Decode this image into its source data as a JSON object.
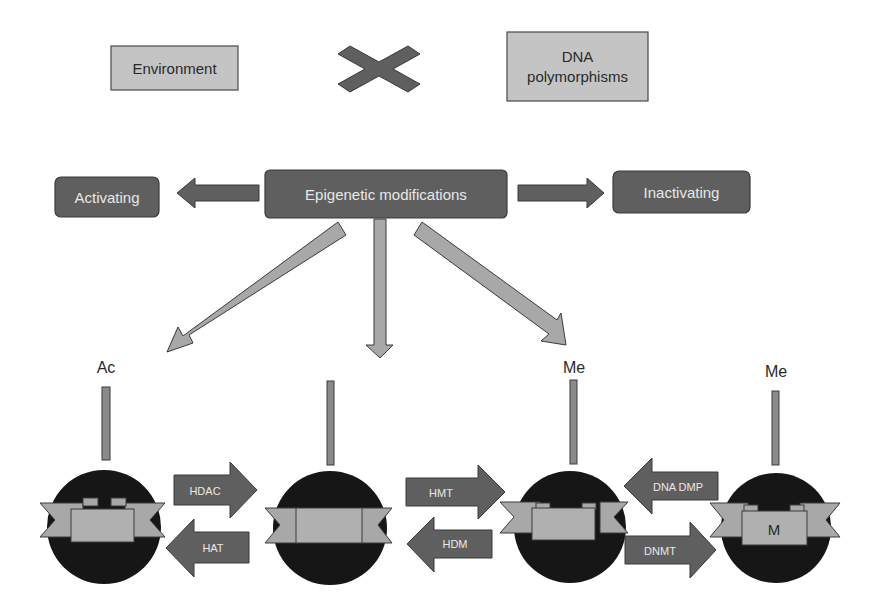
{
  "top_row": {
    "environment_label": "Environment",
    "dna_label_line1": "DNA",
    "dna_label_line2": "polymorphisms",
    "interaction_symbol": "cross-icon"
  },
  "middle_row": {
    "center_label": "Epigenetic modifications",
    "left_label": "Activating",
    "right_label": "Inactivating"
  },
  "nucleosomes": [
    {
      "mark": "Ac",
      "core_label": ""
    },
    {
      "mark": "",
      "core_label": ""
    },
    {
      "mark": "Me",
      "core_label": ""
    },
    {
      "mark": "Me",
      "core_label": "M"
    }
  ],
  "enzymes": {
    "hdac": "HDAC",
    "hat": "HAT",
    "hmt": "HMT",
    "hdm": "HDM",
    "dna_dmp": "DNA DMP",
    "dnmt": "DNMT"
  },
  "colors": {
    "light_box": "#c4c4c4",
    "dark_box": "#5f5f5f",
    "nucleosome": "#161616",
    "ribbon": "#a8a8a8"
  }
}
